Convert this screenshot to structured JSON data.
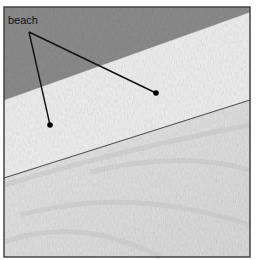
{
  "diagram": {
    "label": "beach",
    "regions": [
      {
        "name": "land",
        "color": "#8f8f8f"
      },
      {
        "name": "beach",
        "color": "#ececec"
      },
      {
        "name": "water",
        "color": "#dcdcdc"
      }
    ],
    "pointers": [
      {
        "target": "beach",
        "x": 50,
        "y": 125
      },
      {
        "target": "beach",
        "x": 156,
        "y": 93
      }
    ]
  }
}
